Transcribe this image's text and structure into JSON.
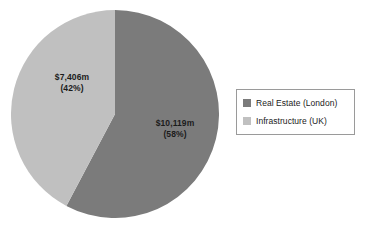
{
  "chart_data": {
    "type": "pie",
    "title": "",
    "subtitle": "",
    "xlabel": "",
    "ylabel": "",
    "grid": false,
    "legend_position": "right",
    "units": "$m",
    "total_value": 17525,
    "start_angle_deg": 0,
    "direction": "counterclockwise",
    "categories": [
      "Real Estate (London)",
      "Infrastructure (UK)"
    ],
    "values": [
      10119,
      7406
    ],
    "percents": [
      58,
      42
    ],
    "colors": [
      "#7b7b7b",
      "#c0c0c0"
    ],
    "slices": [
      {
        "name": "Real Estate (London)",
        "value": 10119,
        "percent": 58,
        "color": "#7b7b7b",
        "label_value": "$10,119m",
        "label_percent": "(58%)"
      },
      {
        "name": "Infrastructure (UK)",
        "value": 7406,
        "percent": 42,
        "color": "#c0c0c0",
        "label_value": "$7,406m",
        "label_percent": "(42%)"
      }
    ],
    "annotations": [
      "$10,119m (58%)",
      "$7,406m (42%)"
    ]
  },
  "pie": {
    "labels": {
      "infrastructure": {
        "value": "$7,406m",
        "percent": "(42%)"
      },
      "real_estate": {
        "value": "$10,119m",
        "percent": "(58%)"
      }
    }
  },
  "legend": {
    "items": [
      {
        "label": "Real Estate (London)",
        "color": "#7b7b7b"
      },
      {
        "label": "Infrastructure (UK)",
        "color": "#c0c0c0"
      }
    ],
    "border_color": "#9a9a9a"
  }
}
